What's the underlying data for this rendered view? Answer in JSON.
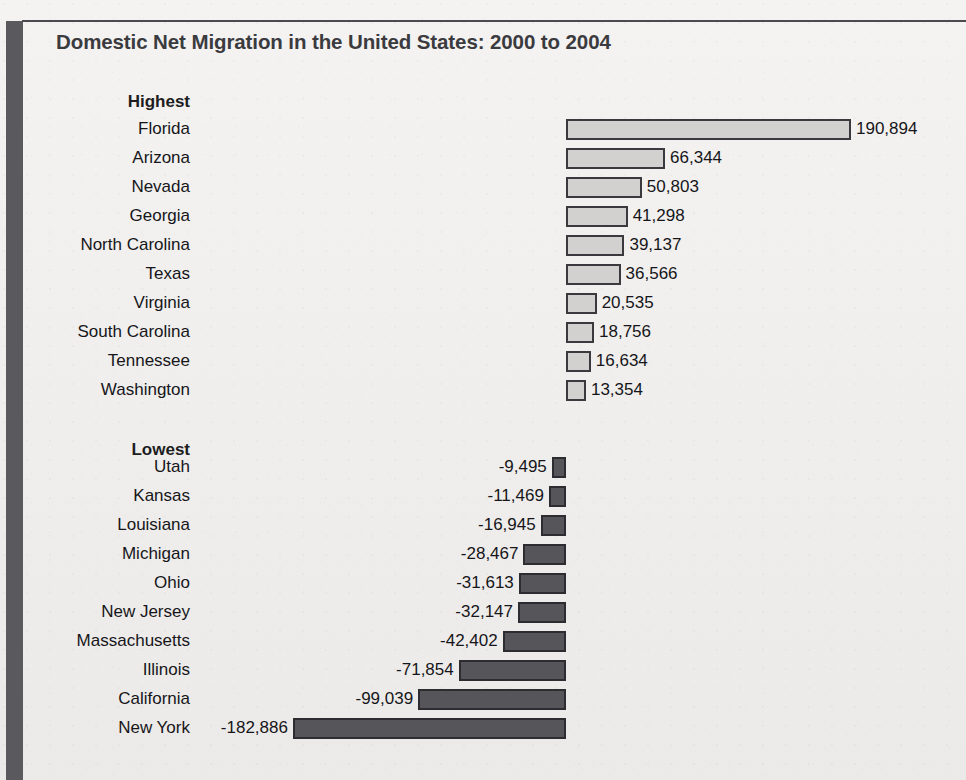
{
  "figure": {
    "title": "Domestic Net Migration in the United States: 2000 to 2004",
    "group_headers": {
      "highest": "Highest",
      "lowest": "Lowest"
    },
    "colors": {
      "positive_bar_fill": "#d2d1cf",
      "positive_bar_border": "#3a3a3e",
      "negative_bar_fill": "#55555a",
      "negative_bar_border": "#2d2d31",
      "rule": "#4b4b4f",
      "left_spine": "#5a5a5e",
      "background": "#f2f1ef",
      "text": "#16161a"
    }
  },
  "chart_data": {
    "type": "bar",
    "orientation": "horizontal",
    "title": "Domestic Net Migration in the United States: 2000 to 2004",
    "xlabel": "",
    "ylabel": "",
    "grid": false,
    "legend": false,
    "axis_zero_line": true,
    "xlim": [
      -182886,
      190894
    ],
    "groups": [
      {
        "name": "Highest",
        "categories": [
          "Florida",
          "Arizona",
          "Nevada",
          "Georgia",
          "North Carolina",
          "Texas",
          "Virginia",
          "South Carolina",
          "Tennessee",
          "Washington"
        ],
        "values": [
          190894,
          66344,
          50803,
          41298,
          39137,
          36566,
          20535,
          18756,
          16634,
          13354
        ],
        "labels": [
          "190,894",
          "66,344",
          "50,803",
          "41,298",
          "39,137",
          "36,566",
          "20,535",
          "18,756",
          "16,634",
          "13,354"
        ]
      },
      {
        "name": "Lowest",
        "categories": [
          "Utah",
          "Kansas",
          "Louisiana",
          "Michigan",
          "Ohio",
          "New Jersey",
          "Massachusetts",
          "Illinois",
          "California",
          "New York"
        ],
        "values": [
          -9495,
          -11469,
          -16945,
          -28467,
          -31613,
          -32147,
          -42402,
          -71854,
          -99039,
          -182886
        ],
        "labels": [
          "-9,495",
          "-11,469",
          "-16,945",
          "-28,467",
          "-31,613",
          "-32,147",
          "-42,402",
          "-71,854",
          "-99,039",
          "-182,886"
        ]
      }
    ]
  }
}
